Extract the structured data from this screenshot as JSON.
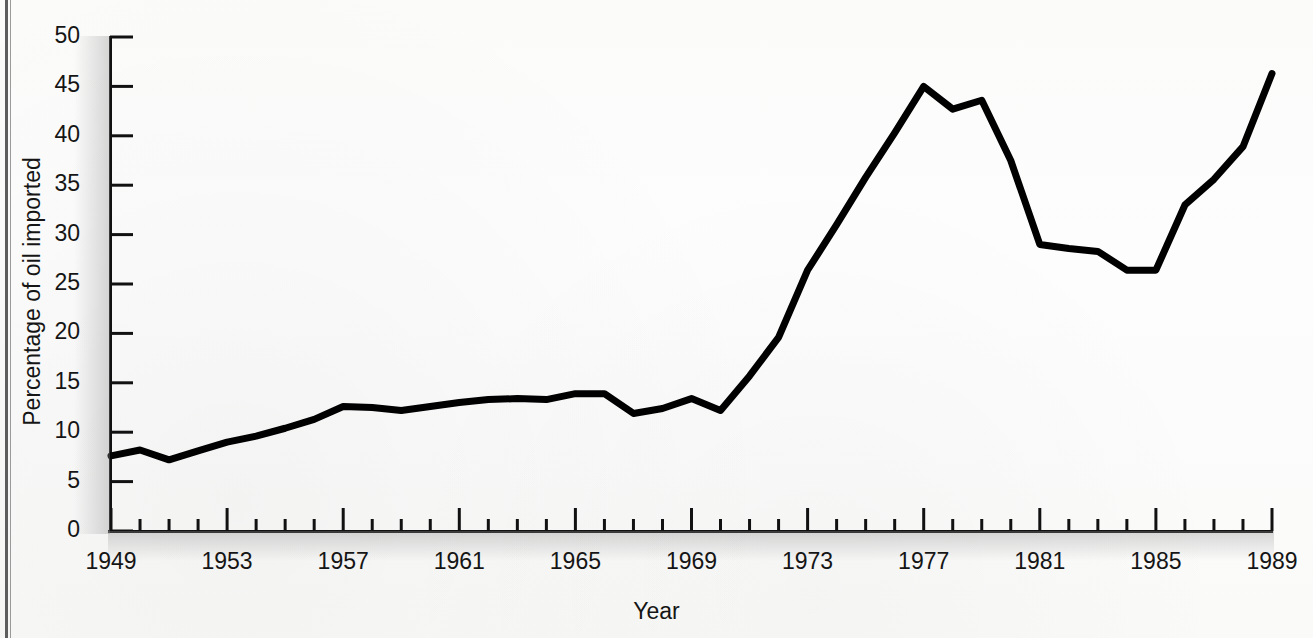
{
  "page": {
    "running_head": "",
    "rule_color": "#5d5d5d"
  },
  "chart_data": {
    "type": "line",
    "title": "",
    "xlabel": "Year",
    "ylabel": "Percentage of oil imported",
    "xlim": [
      1949,
      1989
    ],
    "ylim": [
      0,
      50
    ],
    "grid": false,
    "legend": "none",
    "line_color": "#000000",
    "line_width_px": 7,
    "x_tick_labels": [
      "1949",
      "1953",
      "1957",
      "1961",
      "1965",
      "1969",
      "1973",
      "1977",
      "1981",
      "1985",
      "1989"
    ],
    "x_tick_values": [
      1949,
      1953,
      1957,
      1961,
      1965,
      1969,
      1973,
      1977,
      1981,
      1985,
      1989
    ],
    "x_minor_ticks_every": 1,
    "y_tick_labels": [
      "0",
      "5",
      "10",
      "15",
      "20",
      "25",
      "30",
      "35",
      "40",
      "45",
      "50"
    ],
    "y_tick_values": [
      0,
      5,
      10,
      15,
      20,
      25,
      30,
      35,
      40,
      45,
      50
    ],
    "x": [
      1949,
      1950,
      1951,
      1952,
      1953,
      1954,
      1955,
      1956,
      1957,
      1958,
      1959,
      1960,
      1961,
      1962,
      1963,
      1964,
      1965,
      1966,
      1967,
      1968,
      1969,
      1970,
      1971,
      1972,
      1973,
      1974,
      1975,
      1976,
      1977,
      1978,
      1979,
      1980,
      1981,
      1982,
      1983,
      1984,
      1985,
      1986,
      1987,
      1988,
      1989
    ],
    "values": [
      7.6,
      8.2,
      7.2,
      8.1,
      9.0,
      9.6,
      10.4,
      11.3,
      12.6,
      12.5,
      12.2,
      12.6,
      13.0,
      13.3,
      13.4,
      13.3,
      13.9,
      13.9,
      11.9,
      12.4,
      13.4,
      12.2,
      15.7,
      19.6,
      26.4,
      31.0,
      35.8,
      40.3,
      45.0,
      42.7,
      43.6,
      37.5,
      29.0,
      28.6,
      28.3,
      26.4,
      26.4,
      33.0,
      35.6,
      38.9,
      46.3
    ],
    "series_name": "Percentage of oil imported"
  }
}
